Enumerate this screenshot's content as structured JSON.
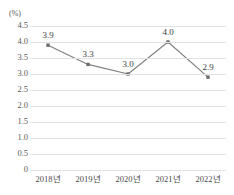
{
  "chart_data": {
    "type": "line",
    "title": "",
    "subtitle": "",
    "xlabel": "",
    "ylabel": "",
    "unit_label": "(%)",
    "categories": [
      "2018년",
      "2019년",
      "2020년",
      "2021년",
      "2022년"
    ],
    "values": [
      3.9,
      3.3,
      3.0,
      4.0,
      2.9
    ],
    "point_labels": [
      "3.9",
      "3.3",
      "3.0",
      "4.0",
      "2.9"
    ],
    "ylim": [
      0,
      4.5
    ],
    "ytick_values": [
      4.5,
      4.0,
      3.5,
      3.0,
      2.5,
      2.0,
      1.5,
      1.0,
      0.5,
      0
    ],
    "ytick_labels": [
      "4.5",
      "4.0",
      "3.5",
      "3.0",
      "2.5",
      "2.0",
      "1.5",
      "1.0",
      "0.5",
      "0"
    ],
    "grid": true,
    "grid_color": "#e2e2e2",
    "legend": false,
    "legend_position": "none",
    "series": [
      {
        "name": "",
        "values": [
          3.9,
          3.3,
          3.0,
          4.0,
          2.9
        ],
        "line_color": "#7f7f7f",
        "marker_color": "#6e6e6e",
        "marker": "square"
      }
    ]
  },
  "colors": {
    "line": "#7f7f7f",
    "marker": "#6e6e6e",
    "grid": "#e2e2e2",
    "axis_text": "#5a5a5a",
    "label_text": "#3a3a3a",
    "background": "#ffffff"
  }
}
